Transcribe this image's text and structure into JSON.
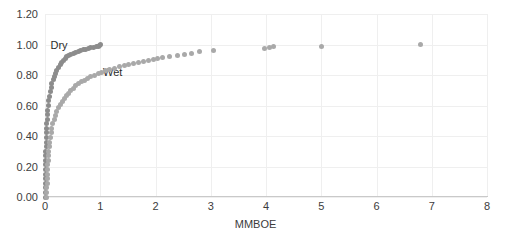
{
  "chart_data": {
    "type": "scatter",
    "title": "",
    "xlabel": "MMBOE",
    "ylabel": "",
    "xlim": [
      0,
      8
    ],
    "ylim": [
      0,
      1.2
    ],
    "x_ticks": [
      "0",
      "1",
      "2",
      "3",
      "4",
      "5",
      "6",
      "7",
      "8"
    ],
    "x_tick_values": [
      0,
      1,
      2,
      3,
      4,
      5,
      6,
      7,
      8
    ],
    "y_ticks": [
      "0.00",
      "0.20",
      "0.40",
      "0.60",
      "0.80",
      "1.00",
      "1.20"
    ],
    "y_tick_values": [
      0.0,
      0.2,
      0.4,
      0.6,
      0.8,
      1.0,
      1.2
    ],
    "grid": true,
    "legend_position": "inline-annotation",
    "annotations": [
      {
        "text": "Dry",
        "x": 0.1,
        "y": 1.0
      },
      {
        "text": "Wet",
        "x": 1.05,
        "y": 0.82
      }
    ],
    "series": [
      {
        "name": "Dry",
        "color": "#8c8c8c",
        "points": [
          [
            0.005,
            0.0
          ],
          [
            0.006,
            0.03
          ],
          [
            0.007,
            0.06
          ],
          [
            0.008,
            0.09
          ],
          [
            0.01,
            0.12
          ],
          [
            0.011,
            0.15
          ],
          [
            0.012,
            0.18
          ],
          [
            0.013,
            0.21
          ],
          [
            0.015,
            0.24
          ],
          [
            0.016,
            0.27
          ],
          [
            0.018,
            0.3
          ],
          [
            0.02,
            0.33
          ],
          [
            0.022,
            0.36
          ],
          [
            0.025,
            0.39
          ],
          [
            0.028,
            0.42
          ],
          [
            0.032,
            0.45
          ],
          [
            0.036,
            0.48
          ],
          [
            0.041,
            0.51
          ],
          [
            0.047,
            0.54
          ],
          [
            0.054,
            0.57
          ],
          [
            0.062,
            0.6
          ],
          [
            0.072,
            0.63
          ],
          [
            0.083,
            0.66
          ],
          [
            0.096,
            0.69
          ],
          [
            0.11,
            0.72
          ],
          [
            0.126,
            0.745
          ],
          [
            0.145,
            0.77
          ],
          [
            0.166,
            0.79
          ],
          [
            0.19,
            0.81
          ],
          [
            0.215,
            0.83
          ],
          [
            0.243,
            0.85
          ],
          [
            0.272,
            0.867
          ],
          [
            0.3,
            0.883
          ],
          [
            0.33,
            0.897
          ],
          [
            0.362,
            0.909
          ],
          [
            0.395,
            0.919
          ],
          [
            0.43,
            0.928
          ],
          [
            0.468,
            0.936
          ],
          [
            0.51,
            0.943
          ],
          [
            0.555,
            0.95
          ],
          [
            0.6,
            0.956
          ],
          [
            0.645,
            0.961
          ],
          [
            0.69,
            0.966
          ],
          [
            0.735,
            0.97
          ],
          [
            0.78,
            0.974
          ],
          [
            0.83,
            0.978
          ],
          [
            0.88,
            0.982
          ],
          [
            0.925,
            0.986
          ],
          [
            0.96,
            0.99
          ],
          [
            0.99,
            0.994
          ],
          [
            1.01,
            0.998
          ]
        ]
      },
      {
        "name": "Wet",
        "color": "#a9a9a9",
        "points": [
          [
            0.03,
            0.0
          ],
          [
            0.032,
            0.03
          ],
          [
            0.034,
            0.06
          ],
          [
            0.037,
            0.09
          ],
          [
            0.04,
            0.12
          ],
          [
            0.043,
            0.15
          ],
          [
            0.047,
            0.18
          ],
          [
            0.051,
            0.21
          ],
          [
            0.056,
            0.24
          ],
          [
            0.062,
            0.27
          ],
          [
            0.069,
            0.3
          ],
          [
            0.077,
            0.33
          ],
          [
            0.086,
            0.36
          ],
          [
            0.097,
            0.39
          ],
          [
            0.11,
            0.42
          ],
          [
            0.125,
            0.45
          ],
          [
            0.143,
            0.48
          ],
          [
            0.164,
            0.51
          ],
          [
            0.188,
            0.535
          ],
          [
            0.215,
            0.56
          ],
          [
            0.245,
            0.585
          ],
          [
            0.278,
            0.605
          ],
          [
            0.312,
            0.625
          ],
          [
            0.348,
            0.645
          ],
          [
            0.386,
            0.663
          ],
          [
            0.425,
            0.68
          ],
          [
            0.466,
            0.697
          ],
          [
            0.51,
            0.713
          ],
          [
            0.556,
            0.728
          ],
          [
            0.604,
            0.742
          ],
          [
            0.655,
            0.755
          ],
          [
            0.71,
            0.767
          ],
          [
            0.768,
            0.778
          ],
          [
            0.83,
            0.789
          ],
          [
            0.895,
            0.799
          ],
          [
            0.962,
            0.809
          ],
          [
            1.03,
            0.818
          ],
          [
            1.1,
            0.827
          ],
          [
            1.175,
            0.836
          ],
          [
            1.255,
            0.845
          ],
          [
            1.34,
            0.853
          ],
          [
            1.43,
            0.861
          ],
          [
            1.52,
            0.869
          ],
          [
            1.61,
            0.876
          ],
          [
            1.7,
            0.883
          ],
          [
            1.79,
            0.889
          ],
          [
            1.875,
            0.896
          ],
          [
            1.96,
            0.902
          ],
          [
            2.04,
            0.908
          ],
          [
            2.13,
            0.914
          ],
          [
            2.26,
            0.921
          ],
          [
            2.4,
            0.929
          ],
          [
            2.52,
            0.936
          ],
          [
            2.65,
            0.944
          ],
          [
            2.79,
            0.952
          ],
          [
            3.05,
            0.962
          ],
          [
            3.98,
            0.972
          ],
          [
            4.06,
            0.978
          ],
          [
            4.14,
            0.984
          ],
          [
            5.0,
            0.99
          ],
          [
            6.8,
            0.998
          ]
        ]
      }
    ]
  }
}
